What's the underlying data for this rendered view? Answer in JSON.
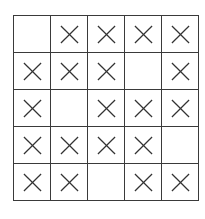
{
  "board": {
    "rows": 5,
    "cols": 5,
    "mark_symbol": "x",
    "mark_color": "#333333",
    "grid_color": "#3a3a3a",
    "cells": [
      [
        "",
        "x",
        "x",
        "x",
        "x"
      ],
      [
        "x",
        "x",
        "x",
        "",
        "x"
      ],
      [
        "x",
        "",
        "x",
        "x",
        "x"
      ],
      [
        "x",
        "x",
        "x",
        "x",
        ""
      ],
      [
        "x",
        "x",
        "",
        "x",
        "x"
      ]
    ]
  }
}
